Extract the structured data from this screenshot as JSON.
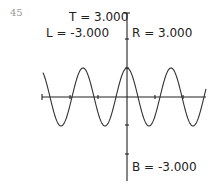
{
  "page": {
    "number": "45"
  },
  "window": {
    "top_label": "T = 3.000",
    "left_label": "L = -3.000",
    "right_label": "R = 3.000",
    "bottom_label": "B = -3.000"
  },
  "colors": {
    "axis": "#222222",
    "curve": "#333333",
    "page_number": "#9a9a9a"
  },
  "chart_data": {
    "type": "line",
    "title": "",
    "function_shape": "cosine-like wave, max at x = 0",
    "xlabel": "",
    "ylabel": "",
    "xlim": [
      -3.0,
      3.0
    ],
    "ylim": [
      -3.0,
      3.0
    ],
    "window_labels": [
      "T = 3.000",
      "L = -3.000",
      "R = 3.000",
      "B = -3.000"
    ],
    "grid": false,
    "legend": null,
    "series": [
      {
        "name": "curve",
        "x": [
          -3.0,
          -2.4,
          -1.8,
          -1.2,
          -0.6,
          0.0,
          0.6,
          1.2,
          1.8,
          2.4,
          3.0
        ],
        "y": [
          0.8,
          -1.0,
          1.0,
          -1.0,
          1.0,
          1.0,
          -1.0,
          1.0,
          -1.0,
          1.0,
          0.8
        ]
      }
    ],
    "peaks_x": [
      -1.2,
      0.0,
      1.2
    ],
    "troughs_x": [
      -1.8,
      -0.6,
      0.6,
      1.8
    ],
    "amplitude": 1.0
  }
}
